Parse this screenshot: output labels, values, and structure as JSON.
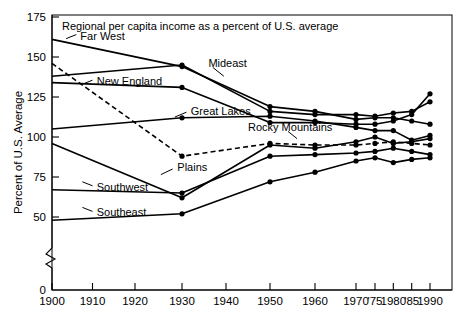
{
  "chart_data": {
    "type": "line",
    "title": "Regional per capita income as a percent of U.S. average",
    "xlabel": "",
    "ylabel": "Percent of U.S. Average",
    "x": [
      1900,
      1930,
      1950,
      1960,
      1970,
      1975,
      1980,
      1985,
      1990
    ],
    "xtick_labels": [
      "1900",
      "1910",
      "1920",
      "1930",
      "1940",
      "1950",
      "1960",
      "1970",
      "'75",
      "1980",
      "'85",
      "1990"
    ],
    "xtick_values": [
      1900,
      1910,
      1920,
      1930,
      1940,
      1950,
      1960,
      1970,
      1975,
      1980,
      1985,
      1990
    ],
    "ytick_labels": [
      "0",
      "50",
      "75",
      "100",
      "125",
      "150",
      "175"
    ],
    "ytick_values": [
      0,
      50,
      75,
      100,
      125,
      150,
      175
    ],
    "ylim": [
      45,
      175
    ],
    "y_axis_break": true,
    "y_axis_break_note": "axis broken between 0 and ~46",
    "grid": false,
    "legend": "inline-labels",
    "series": [
      {
        "name": "Far West",
        "style": "solid",
        "x": [
          1900,
          1930,
          1950,
          1960,
          1970,
          1975,
          1980,
          1985,
          1990
        ],
        "values": [
          161,
          144,
          119,
          116,
          111,
          112,
          112,
          110,
          108
        ]
      },
      {
        "name": "Mideast",
        "style": "solid",
        "x": [
          1900,
          1930,
          1950,
          1960,
          1970,
          1975,
          1980,
          1985,
          1990
        ],
        "values": [
          138,
          145,
          116,
          114,
          114,
          113,
          115,
          116,
          122
        ]
      },
      {
        "name": "New England",
        "style": "solid",
        "x": [
          1900,
          1930,
          1950,
          1960,
          1970,
          1975,
          1980,
          1985,
          1990
        ],
        "values": [
          134,
          131,
          109,
          109,
          108,
          108,
          110,
          114,
          127
        ]
      },
      {
        "name": "Great Lakes",
        "style": "solid",
        "x": [
          1900,
          1930,
          1950,
          1960,
          1970,
          1975,
          1980,
          1985,
          1990
        ],
        "values": [
          105,
          112,
          113,
          110,
          106,
          104,
          104,
          98,
          101
        ]
      },
      {
        "name": "Rocky Mountains",
        "style": "dashed",
        "x": [
          1900,
          1930,
          1950,
          1960,
          1970,
          1975,
          1980,
          1985,
          1990
        ],
        "values": [
          146,
          88,
          96,
          95,
          95,
          96,
          97,
          96,
          95
        ]
      },
      {
        "name": "Plains",
        "style": "solid",
        "x": [
          1900,
          1930,
          1950,
          1960,
          1970,
          1975,
          1980,
          1985,
          1990
        ],
        "values": [
          96,
          62,
          95,
          93,
          97,
          100,
          96,
          97,
          99
        ]
      },
      {
        "name": "Southwest",
        "style": "solid",
        "x": [
          1900,
          1930,
          1950,
          1960,
          1970,
          1975,
          1980,
          1985,
          1990
        ],
        "values": [
          67,
          65,
          88,
          89,
          90,
          91,
          93,
          91,
          89
        ]
      },
      {
        "name": "Southeast",
        "style": "solid",
        "x": [
          1900,
          1930,
          1950,
          1960,
          1970,
          1975,
          1980,
          1985,
          1990
        ],
        "values": [
          48,
          52,
          72,
          78,
          85,
          87,
          84,
          86,
          87
        ]
      }
    ],
    "annotations": [
      {
        "label": "Far West",
        "x": 1907,
        "y": 163
      },
      {
        "label": "Mideast",
        "x": 1936,
        "y": 146
      },
      {
        "label": "New England",
        "x": 1911,
        "y": 135
      },
      {
        "label": "Great Lakes",
        "x": 1932,
        "y": 116
      },
      {
        "label": "Rocky Mountains",
        "x": 1945,
        "y": 106
      },
      {
        "label": "Plains",
        "x": 1929,
        "y": 81
      },
      {
        "label": "Southwest",
        "x": 1911,
        "y": 69
      },
      {
        "label": "Southeast",
        "x": 1911,
        "y": 53
      }
    ]
  }
}
